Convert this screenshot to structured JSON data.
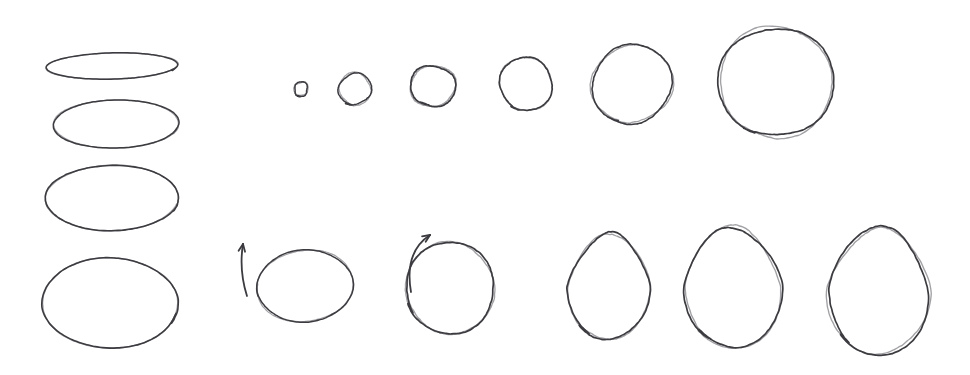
{
  "canvas": {
    "width": 970,
    "height": 375,
    "background_color": "#ffffff",
    "ink_color": "#3b3b40",
    "ink_color_light": "#55555c",
    "title": "Hand-drawn ellipse and circle sketch sheet",
    "description": "Whiteboard-style pen sketch: a left column of four ellipses flattening to round, a top row of six circles increasing in size, and a bottom row of six ovals becoming taller and more egg-shaped, with two small direction arrows."
  },
  "groups": [
    {
      "id": "left-column",
      "name": "left-column-ellipses",
      "label": "Left column of flattened ellipses",
      "shapes": [
        {
          "name": "ellipse-left-1",
          "label": "Very flat ellipse",
          "kind": "ellipse",
          "cx": 112,
          "cy": 66,
          "rx": 66,
          "ry": 13,
          "rotate": -1.5,
          "stroke_width": 1.5,
          "wobble": 0.5,
          "overlap": 18,
          "start_angle": 8
        },
        {
          "name": "ellipse-left-2",
          "label": "Flat ellipse",
          "kind": "ellipse",
          "cx": 116,
          "cy": 124,
          "rx": 63,
          "ry": 24,
          "rotate": -1,
          "stroke_width": 1.5,
          "wobble": 0.7,
          "overlap": 16,
          "start_angle": 10
        },
        {
          "name": "ellipse-left-3",
          "label": "Wide ellipse",
          "kind": "ellipse",
          "cx": 112,
          "cy": 198,
          "rx": 66,
          "ry": 33,
          "rotate": -0.5,
          "stroke_width": 1.6,
          "wobble": 0.8,
          "overlap": 12,
          "start_angle": 12
        },
        {
          "name": "ellipse-left-4",
          "label": "Near-round ellipse",
          "kind": "ellipse",
          "cx": 110,
          "cy": 303,
          "rx": 68,
          "ry": 45,
          "rotate": -0.5,
          "stroke_width": 1.6,
          "wobble": 0.9,
          "overlap": 14,
          "start_angle": 14
        }
      ]
    },
    {
      "id": "top-row",
      "name": "top-row-circles",
      "label": "Top row of circles increasing in size",
      "shapes": [
        {
          "name": "circle-top-1",
          "label": "Smallest circle",
          "kind": "ellipse",
          "cx": 301,
          "cy": 89,
          "rx": 7,
          "ry": 7,
          "rotate": 0,
          "stroke_width": 1.5,
          "wobble": 0.8,
          "overlap": 40,
          "start_angle": 95
        },
        {
          "name": "circle-top-2",
          "label": "Small circle",
          "kind": "ellipse",
          "cx": 355,
          "cy": 89,
          "rx": 16,
          "ry": 16,
          "rotate": 0,
          "stroke_width": 1.5,
          "wobble": 1.0,
          "overlap": 26,
          "start_angle": 100
        },
        {
          "name": "circle-top-3",
          "label": "Medium-small circle",
          "kind": "ellipse",
          "cx": 433,
          "cy": 86,
          "rx": 22,
          "ry": 21,
          "rotate": 0,
          "stroke_width": 1.7,
          "wobble": 1.3,
          "overlap": 28,
          "start_angle": 102
        },
        {
          "name": "circle-top-4",
          "label": "Medium circle",
          "kind": "ellipse",
          "cx": 526,
          "cy": 84,
          "rx": 27,
          "ry": 26,
          "rotate": 0,
          "stroke_width": 1.6,
          "wobble": 1.2,
          "overlap": 20,
          "start_angle": 105
        },
        {
          "name": "circle-top-5",
          "label": "Large circle",
          "kind": "ellipse",
          "cx": 632,
          "cy": 84,
          "rx": 40,
          "ry": 39,
          "rotate": 0,
          "stroke_width": 1.6,
          "wobble": 1.6,
          "overlap": 18,
          "start_angle": 110
        },
        {
          "name": "circle-top-6",
          "label": "Largest circle",
          "kind": "ellipse",
          "cx": 776,
          "cy": 82,
          "rx": 57,
          "ry": 55,
          "rotate": 0,
          "stroke_width": 1.7,
          "wobble": 1.8,
          "overlap": 14,
          "start_angle": 112
        }
      ]
    },
    {
      "id": "bottom-row",
      "name": "bottom-row-ovals",
      "label": "Bottom row of ovals becoming taller and egg-shaped",
      "shapes": [
        {
          "name": "oval-bottom-1",
          "label": "Wide teardrop oval",
          "kind": "ellipse",
          "cx": 305,
          "cy": 286,
          "rx": 48,
          "ry": 36,
          "rotate": -6,
          "stroke_width": 1.5,
          "wobble": 0.8,
          "overlap": 22,
          "start_angle": 172
        },
        {
          "name": "oval-bottom-2",
          "label": "Round oval",
          "kind": "ellipse",
          "cx": 450,
          "cy": 288,
          "rx": 45,
          "ry": 45,
          "rotate": -4,
          "stroke_width": 1.7,
          "wobble": 1.4,
          "overlap": 16,
          "start_angle": 150
        },
        {
          "name": "oval-bottom-3",
          "label": "Egg shape, narrow top",
          "kind": "egg",
          "cx": 609,
          "cy": 286,
          "rx": 41,
          "ry": 54,
          "taper": 0.7,
          "rotate": -1,
          "stroke_width": 1.7,
          "wobble": 1.1,
          "overlap": 18,
          "start_angle": 120
        },
        {
          "name": "oval-bottom-4",
          "label": "Tall egg shape",
          "kind": "egg",
          "cx": 733,
          "cy": 287,
          "rx": 49,
          "ry": 61,
          "taper": 0.74,
          "rotate": -1,
          "stroke_width": 1.7,
          "wobble": 1.2,
          "overlap": 16,
          "start_angle": 122
        },
        {
          "name": "oval-bottom-5",
          "label": "Largest egg shape",
          "kind": "egg",
          "cx": 879,
          "cy": 291,
          "rx": 51,
          "ry": 64,
          "taper": 0.76,
          "rotate": 2,
          "stroke_width": 1.7,
          "wobble": 1.3,
          "overlap": 14,
          "start_angle": 124
        }
      ]
    }
  ],
  "annotations": [
    {
      "name": "direction-arrow-straight",
      "label": "Upward straight direction arrow",
      "kind": "arrow-straight",
      "x1": 247,
      "y1": 296,
      "x2": 243,
      "y2": 244,
      "head_size": 8,
      "stroke_width": 1.8,
      "curve": 0.12
    },
    {
      "name": "direction-arrow-curved",
      "label": "Curved counter-clockwise direction arrow",
      "kind": "arrow-curved",
      "x1": 411,
      "y1": 292,
      "cx": 404,
      "cy": 252,
      "x2": 430,
      "y2": 235,
      "head_size": 8,
      "stroke_width": 1.8
    }
  ]
}
